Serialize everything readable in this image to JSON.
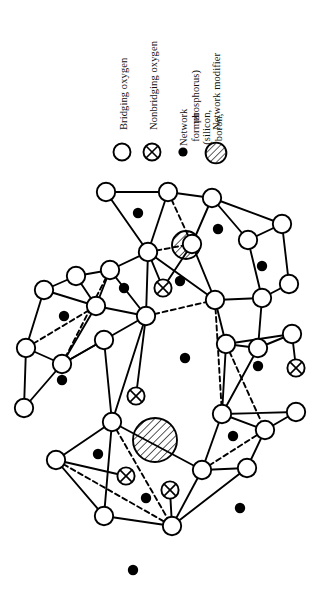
{
  "figure": {
    "kind": "random-network-glass-structure",
    "background_color": "#ffffff",
    "ink_color": "#000000"
  },
  "legend": {
    "entries": [
      {
        "label": "Bridging oxygen",
        "symbol": "open-circle",
        "symbol_name": "bridging-oxygen-symbol",
        "label_x": 118,
        "label_y": 130,
        "sym_x": 122,
        "sym_y": 152,
        "sym_r": 8.5
      },
      {
        "label": "Nonbridging oxygen",
        "symbol": "crossed-circle",
        "symbol_name": "nonbridging-oxygen-symbol",
        "label_x": 148,
        "label_y": 130,
        "sym_x": 152,
        "sym_y": 152,
        "sym_r": 8.5
      },
      {
        "label": "Network former (silicon, boron, phosphorus)",
        "label_line_1": "Network former (silicon, boron,",
        "label_line_2": "phosphorus)",
        "symbol": "filled-dot",
        "symbol_name": "network-former-symbol",
        "label_x": 178,
        "label_y": 130,
        "sym_x": 183,
        "sym_y": 152,
        "sym_r": 4.5
      },
      {
        "label": "Network modifier",
        "symbol": "hatched-circle",
        "symbol_name": "network-modifier-symbol",
        "label_x": 211,
        "label_y": 130,
        "sym_x": 215,
        "sym_y": 152,
        "sym_r": 10.5
      }
    ]
  },
  "network": {
    "bridging_oxygen_radius": 9.2,
    "nonbridging_oxygen_radius": 8.6,
    "network_former_radius": 5.2,
    "bond_width": 1.9,
    "dashed_pattern": "5,3.5",
    "bridging_oxygen": [
      {
        "id": "o1",
        "x": 106,
        "y": 24
      },
      {
        "id": "o2",
        "x": 168,
        "y": 24
      },
      {
        "id": "o3",
        "x": 212,
        "y": 30
      },
      {
        "id": "o4",
        "x": 148,
        "y": 84
      },
      {
        "id": "o5",
        "x": 192,
        "y": 76
      },
      {
        "id": "o6",
        "x": 248,
        "y": 72
      },
      {
        "id": "o7",
        "x": 282,
        "y": 56
      },
      {
        "id": "o8",
        "x": 76,
        "y": 108
      },
      {
        "id": "o9",
        "x": 110,
        "y": 102
      },
      {
        "id": "o10",
        "x": 44,
        "y": 122
      },
      {
        "id": "o11",
        "x": 96,
        "y": 138
      },
      {
        "id": "o12",
        "x": 215,
        "y": 132
      },
      {
        "id": "o13",
        "x": 262,
        "y": 130
      },
      {
        "id": "o14",
        "x": 289,
        "y": 116
      },
      {
        "id": "o15",
        "x": 146,
        "y": 148
      },
      {
        "id": "o16",
        "x": 26,
        "y": 180
      },
      {
        "id": "o17",
        "x": 62,
        "y": 196
      },
      {
        "id": "o18",
        "x": 104,
        "y": 172
      },
      {
        "id": "o19",
        "x": 226,
        "y": 176
      },
      {
        "id": "o20",
        "x": 258,
        "y": 180
      },
      {
        "id": "o21",
        "x": 292,
        "y": 166
      },
      {
        "id": "o22",
        "x": 112,
        "y": 254
      },
      {
        "id": "o23",
        "x": 222,
        "y": 246
      },
      {
        "id": "o24",
        "x": 265,
        "y": 262
      },
      {
        "id": "o25",
        "x": 296,
        "y": 244
      },
      {
        "id": "o26",
        "x": 56,
        "y": 292
      },
      {
        "id": "o27",
        "x": 202,
        "y": 302
      },
      {
        "id": "o28",
        "x": 247,
        "y": 300
      },
      {
        "id": "o29",
        "x": 104,
        "y": 348
      },
      {
        "id": "o30",
        "x": 172,
        "y": 358
      },
      {
        "id": "o31",
        "x": 24,
        "y": 240
      }
    ],
    "nonbridging_oxygen": [
      {
        "id": "n1",
        "x": 163,
        "y": 120
      },
      {
        "id": "n2",
        "x": 136,
        "y": 228
      },
      {
        "id": "n3",
        "x": 126,
        "y": 308
      },
      {
        "id": "n4",
        "x": 170,
        "y": 322
      },
      {
        "id": "n5",
        "x": 296,
        "y": 200
      }
    ],
    "network_former": [
      {
        "id": "f1",
        "x": 138,
        "y": 45
      },
      {
        "id": "f2",
        "x": 218,
        "y": 61
      },
      {
        "id": "f3",
        "x": 124,
        "y": 120
      },
      {
        "id": "f4",
        "x": 64,
        "y": 148
      },
      {
        "id": "f5",
        "x": 180,
        "y": 113
      },
      {
        "id": "f6",
        "x": 262,
        "y": 98
      },
      {
        "id": "f7",
        "x": 185,
        "y": 190
      },
      {
        "id": "f8",
        "x": 62,
        "y": 212
      },
      {
        "id": "f9",
        "x": 258,
        "y": 198
      },
      {
        "id": "f10",
        "x": 98,
        "y": 286
      },
      {
        "id": "f11",
        "x": 233,
        "y": 268
      },
      {
        "id": "f12",
        "x": 146,
        "y": 330
      },
      {
        "id": "f13",
        "x": 240,
        "y": 340
      },
      {
        "id": "f14",
        "x": 133,
        "y": 402
      }
    ],
    "network_modifier": [
      {
        "id": "m1",
        "x": 186,
        "y": 77,
        "r": 14
      },
      {
        "id": "m2",
        "x": 155,
        "y": 272,
        "r": 22
      }
    ],
    "bonds_solid": [
      [
        "o1",
        "o2"
      ],
      [
        "o1",
        "o4"
      ],
      [
        "o2",
        "o4"
      ],
      [
        "o2",
        "o3"
      ],
      [
        "o3",
        "o5"
      ],
      [
        "o3",
        "o6"
      ],
      [
        "o6",
        "o7"
      ],
      [
        "o3",
        "o7"
      ],
      [
        "o4",
        "o12"
      ],
      [
        "o4",
        "o9"
      ],
      [
        "o4",
        "o15"
      ],
      [
        "o5",
        "o12"
      ],
      [
        "o6",
        "o13"
      ],
      [
        "o7",
        "o14"
      ],
      [
        "o8",
        "o9"
      ],
      [
        "o8",
        "o10"
      ],
      [
        "o9",
        "o11"
      ],
      [
        "o10",
        "o11"
      ],
      [
        "o8",
        "o11"
      ],
      [
        "o9",
        "o15"
      ],
      [
        "o11",
        "o15"
      ],
      [
        "o12",
        "o13"
      ],
      [
        "o13",
        "o14"
      ],
      [
        "o12",
        "o19"
      ],
      [
        "o10",
        "o16"
      ],
      [
        "o11",
        "o17"
      ],
      [
        "o16",
        "o17"
      ],
      [
        "o17",
        "o18"
      ],
      [
        "o15",
        "o18"
      ],
      [
        "o18",
        "o17"
      ],
      [
        "o13",
        "o20"
      ],
      [
        "o19",
        "o20"
      ],
      [
        "o20",
        "o21"
      ],
      [
        "o19",
        "o21"
      ],
      [
        "o18",
        "o22"
      ],
      [
        "o16",
        "o31"
      ],
      [
        "o31",
        "o17"
      ],
      [
        "o19",
        "o23"
      ],
      [
        "o23",
        "o24"
      ],
      [
        "o24",
        "o25"
      ],
      [
        "o23",
        "o25"
      ],
      [
        "o22",
        "o26"
      ],
      [
        "o22",
        "o29"
      ],
      [
        "o26",
        "o29"
      ],
      [
        "o23",
        "o27"
      ],
      [
        "o27",
        "o28"
      ],
      [
        "o28",
        "o24"
      ],
      [
        "o27",
        "o30"
      ],
      [
        "o29",
        "o30"
      ],
      [
        "o28",
        "o30"
      ],
      [
        "o15",
        "o22"
      ],
      [
        "o20",
        "o23"
      ],
      [
        "o22",
        "o27"
      ],
      [
        "n1",
        "o4"
      ],
      [
        "n1",
        "o5"
      ],
      [
        "n2",
        "o15"
      ],
      [
        "n3",
        "o26"
      ],
      [
        "n4",
        "o30"
      ],
      [
        "n5",
        "o21"
      ]
    ],
    "bonds_dashed": [
      [
        "o2",
        "o5"
      ],
      [
        "o4",
        "o5"
      ],
      [
        "o9",
        "o17"
      ],
      [
        "o11",
        "o16"
      ],
      [
        "o15",
        "o12"
      ],
      [
        "o19",
        "o24"
      ],
      [
        "o22",
        "o30"
      ],
      [
        "o27",
        "o24"
      ],
      [
        "o26",
        "o30"
      ],
      [
        "o12",
        "o23"
      ]
    ]
  }
}
